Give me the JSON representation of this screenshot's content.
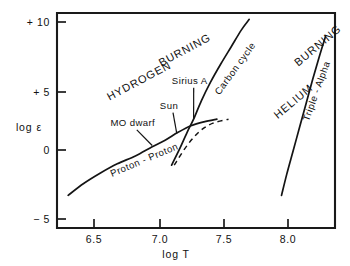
{
  "chart_data": {
    "type": "line",
    "title": "",
    "subtitle": "",
    "xlabel": "log T",
    "ylabel": "log ε",
    "xlim": [
      6.2,
      8.5
    ],
    "ylim": [
      -7.0,
      12.0
    ],
    "grid": false,
    "legend_position": "none",
    "xticks": [
      {
        "value": 6.5,
        "label": "6.5"
      },
      {
        "value": 7.0,
        "label": "7.0"
      },
      {
        "value": 7.5,
        "label": "7.5"
      },
      {
        "value": 8.0,
        "label": "8.0"
      }
    ],
    "yticks": [
      {
        "value": 10,
        "label": "+ 10"
      },
      {
        "value": 5,
        "label": "+ 5"
      },
      {
        "value": 0,
        "label": "0"
      },
      {
        "value": -5,
        "label": "− 5"
      }
    ],
    "series": [
      {
        "name": "Proton - Proton",
        "style": "solid",
        "points": [
          [
            6.3,
            -3.2
          ],
          [
            6.42,
            -2.3
          ],
          [
            6.55,
            -1.5
          ],
          [
            6.68,
            -0.8
          ],
          [
            6.82,
            -0.2
          ],
          [
            6.95,
            0.5
          ],
          [
            7.05,
            1.0
          ],
          [
            7.15,
            1.6
          ],
          [
            7.25,
            2.1
          ],
          [
            7.35,
            2.4
          ],
          [
            7.45,
            2.6
          ]
        ]
      },
      {
        "name": "Carbon cycle",
        "style": "solid",
        "points": [
          [
            7.1,
            -0.9
          ],
          [
            7.16,
            0.3
          ],
          [
            7.22,
            1.6
          ],
          [
            7.27,
            2.6
          ],
          [
            7.33,
            4.0
          ],
          [
            7.4,
            5.4
          ],
          [
            7.48,
            6.8
          ],
          [
            7.56,
            8.1
          ],
          [
            7.64,
            9.4
          ],
          [
            7.7,
            10.2
          ]
        ]
      },
      {
        "name": "Triple - Alpha",
        "style": "solid",
        "points": [
          [
            7.95,
            -3.2
          ],
          [
            7.99,
            -1.6
          ],
          [
            8.04,
            0.2
          ],
          [
            8.09,
            2.0
          ],
          [
            8.14,
            3.8
          ],
          [
            8.19,
            5.6
          ],
          [
            8.24,
            7.3
          ],
          [
            8.29,
            8.9
          ]
        ]
      },
      {
        "name": "pp-extension-dashed",
        "style": "dashed",
        "points": [
          [
            7.12,
            -0.9
          ],
          [
            7.22,
            0.6
          ],
          [
            7.32,
            1.7
          ],
          [
            7.42,
            2.3
          ],
          [
            7.54,
            2.6
          ]
        ]
      }
    ],
    "region_labels": [
      {
        "text": "HYDROGEN",
        "x": 6.62,
        "y": 4.0,
        "rotation": -28
      },
      {
        "text": "BURNING",
        "x": 7.02,
        "y": 6.6,
        "rotation": -28
      },
      {
        "text": "HELIUM",
        "x": 7.92,
        "y": 2.6,
        "rotation": -40
      },
      {
        "text": "BURNING",
        "x": 8.08,
        "y": 6.6,
        "rotation": -40
      }
    ],
    "curve_labels": [
      {
        "text": "Proton - Proton",
        "x": 6.64,
        "y": -1.8,
        "rotation": -23
      },
      {
        "text": "Carbon cycle",
        "x": 7.47,
        "y": 4.4,
        "rotation": -54
      },
      {
        "text": "Triple - Alpha",
        "x": 8.16,
        "y": 2.4,
        "rotation": -70
      }
    ],
    "annotations": [
      {
        "label": "MO dwarf",
        "x": 6.8,
        "y": 2.1,
        "target_x": 6.95,
        "target_y": 0.6
      },
      {
        "label": "Sun",
        "x": 7.08,
        "y": 3.4,
        "target_x": 7.14,
        "target_y": 1.5
      },
      {
        "label": "Sirius A",
        "x": 7.24,
        "y": 5.3,
        "target_x": 7.27,
        "target_y": 2.6
      }
    ]
  },
  "axis": {
    "x_title": "log T",
    "y_title": "log ε"
  },
  "colors": {
    "ink": "#141414",
    "background": "#ffffff"
  }
}
